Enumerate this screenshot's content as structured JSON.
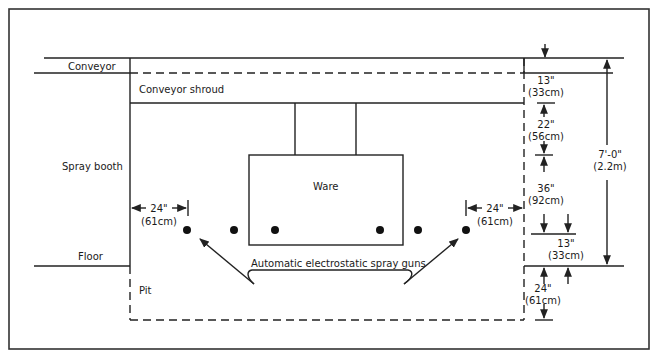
{
  "diagram": {
    "labels": {
      "conveyor": "Conveyor",
      "conveyor_shroud": "Conveyor shroud",
      "spray_booth": "Spray booth",
      "ware": "Ware",
      "floor": "Floor",
      "pit": "Pit",
      "spray_guns": "Automatic electrostatic spray guns"
    },
    "dimensions": {
      "left_gun_offset": {
        "imperial": "24\"",
        "metric": "(61cm)"
      },
      "right_gun_offset": {
        "imperial": "24\"",
        "metric": "(61cm)"
      },
      "conveyor_height": {
        "imperial": "13\"",
        "metric": "(33cm)"
      },
      "shroud_height": {
        "imperial": "22\"",
        "metric": "(56cm)"
      },
      "ware_height": {
        "imperial": "36\"",
        "metric": "(92cm)"
      },
      "gun_above_floor": {
        "imperial": "13\"",
        "metric": "(33cm)"
      },
      "pit_depth": {
        "imperial": "24\"",
        "metric": "(61cm)"
      },
      "total_height": {
        "imperial": "7'-0\"",
        "metric": "(2.2m)"
      }
    },
    "spray_gun_count": 6
  }
}
